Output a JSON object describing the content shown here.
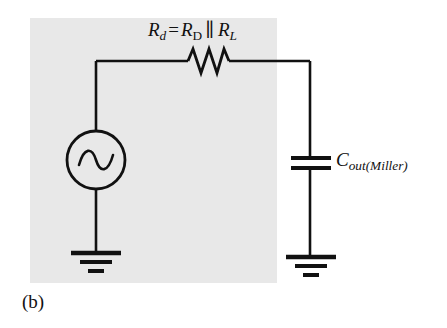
{
  "figure": {
    "caption": "(b)",
    "panel_color": "#e8e8e8",
    "line_color": "#111111",
    "background_color": "#ffffff"
  },
  "labels": {
    "resistor": {
      "full_text": "Rd = RD ∥ RL",
      "main_symbol": "R",
      "main_subscript": "d",
      "operator": "=",
      "first_term_symbol": "R",
      "first_term_subscript": "D",
      "parallel_operator": "∥",
      "second_term_symbol": "R",
      "second_term_subscript": "L"
    },
    "capacitor": {
      "full_text": "Cout(Miller)",
      "main_symbol": "C",
      "subscript": "out(Miller)"
    }
  },
  "components": [
    {
      "name": "ac-voltage-source",
      "type": "ac-source",
      "symbol": "circle-with-sine-wave"
    },
    {
      "name": "resistor-rd",
      "type": "resistor",
      "symbol": "zigzag",
      "label": "Rd = RD ∥ RL"
    },
    {
      "name": "capacitor-cout-miller",
      "type": "capacitor",
      "symbol": "parallel-plates",
      "label": "Cout(Miller)"
    },
    {
      "name": "ground-left",
      "type": "ground",
      "symbol": "three-bar-ground"
    },
    {
      "name": "ground-right",
      "type": "ground",
      "symbol": "three-bar-ground"
    }
  ]
}
